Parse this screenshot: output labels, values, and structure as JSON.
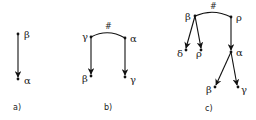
{
  "figure": {
    "panels": [
      {
        "caption": "a)",
        "nodes": {
          "top": "β",
          "bottom": "α"
        }
      },
      {
        "caption": "b)",
        "link_label": "#",
        "nodes": {
          "left_top": "γ",
          "right_top": "α",
          "left_bottom": "β",
          "right_bottom": "γ"
        }
      },
      {
        "caption": "c)",
        "link_label": "#",
        "nodes": {
          "left_top": "β",
          "right_top": "ρ",
          "left_child_1": "δ",
          "left_child_2": "ρ",
          "right_mid": "α",
          "mid_child_1": "β",
          "mid_child_2": "γ"
        }
      }
    ]
  }
}
